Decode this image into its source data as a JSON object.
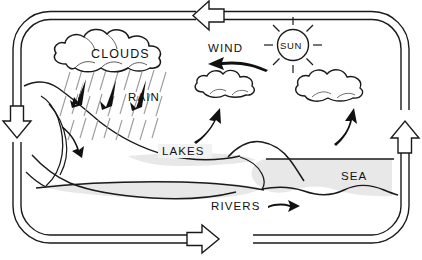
{
  "diagram": {
    "type": "water-cycle-diagram",
    "background_color": "#ffffff",
    "line_color": "#1a1a1a",
    "water_fill_color": "#e8e8e8",
    "cloud_fill_color": "#ececec",
    "rain_streak_color": "#9a9a9a",
    "labels": {
      "clouds": "CLOUDS",
      "rain": "RAIN",
      "wind": "WIND",
      "sun": "SUN",
      "lakes": "LAKES",
      "sea": "SEA",
      "rivers": "RIVERS"
    },
    "cycle_arrows": [
      {
        "name": "top-arrow",
        "direction": "left"
      },
      {
        "name": "left-arrow",
        "direction": "down"
      },
      {
        "name": "bottom-arrow",
        "direction": "right"
      },
      {
        "name": "right-arrow",
        "direction": "up"
      }
    ],
    "flow_arrows": [
      {
        "name": "rain-fall-arrow-1",
        "direction": "down-left"
      },
      {
        "name": "rain-fall-arrow-2",
        "direction": "down-left"
      },
      {
        "name": "rain-fall-arrow-3",
        "direction": "down-left"
      },
      {
        "name": "runoff-arrow",
        "direction": "down-right"
      },
      {
        "name": "wind-arrow",
        "direction": "left"
      },
      {
        "name": "evaporation-arrow-left",
        "direction": "up"
      },
      {
        "name": "evaporation-arrow-right",
        "direction": "up"
      },
      {
        "name": "river-flow-arrow",
        "direction": "right"
      }
    ],
    "elements": {
      "main_cloud": "large rain cloud at upper left",
      "small_cloud_left": "small cloud above lakes",
      "small_cloud_right": "small cloud above sea",
      "sun_rays": 8,
      "mountain": "mountain range at left",
      "water_bodies": [
        "lakes",
        "rivers",
        "sea"
      ]
    }
  }
}
